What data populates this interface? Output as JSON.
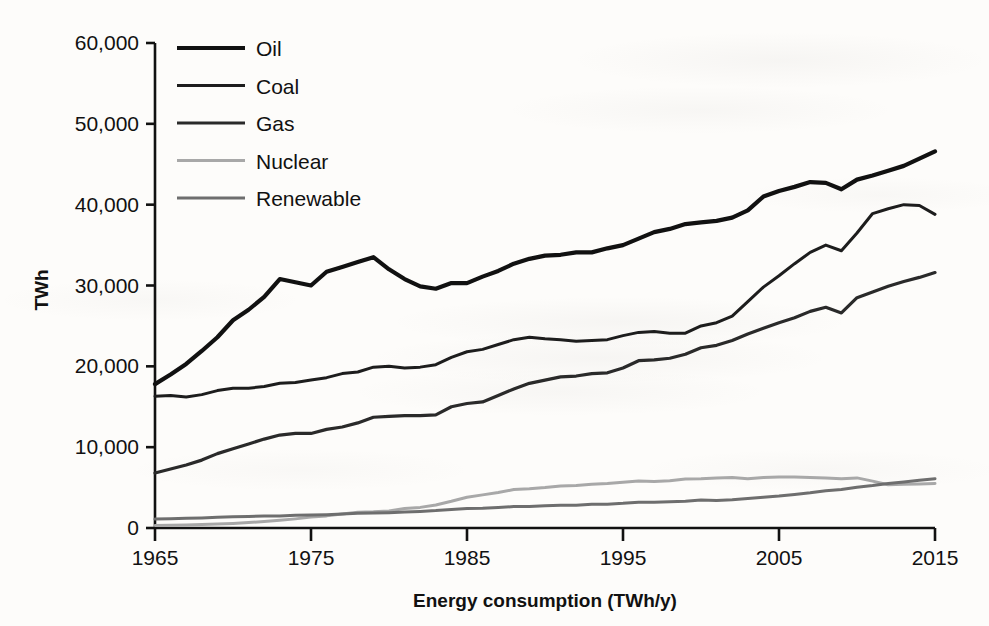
{
  "chart_data": {
    "type": "line",
    "title": "",
    "xlabel": "Energy consumption (TWh/y)",
    "ylabel": "TWh",
    "xlim": [
      1965,
      2015
    ],
    "ylim": [
      0,
      60000
    ],
    "xticks": [
      "1965",
      "1975",
      "1985",
      "1995",
      "2005",
      "2015"
    ],
    "xtick_values": [
      1965,
      1975,
      1985,
      1995,
      2005,
      2015
    ],
    "yticks": [
      "0",
      "10,000",
      "20,000",
      "30,000",
      "40,000",
      "50,000",
      "60,000"
    ],
    "ytick_values": [
      0,
      10000,
      20000,
      30000,
      40000,
      50000,
      60000
    ],
    "grid": false,
    "legend_position": "top-left",
    "x": [
      1965,
      1966,
      1967,
      1968,
      1969,
      1970,
      1971,
      1972,
      1973,
      1974,
      1975,
      1976,
      1977,
      1978,
      1979,
      1980,
      1981,
      1982,
      1983,
      1984,
      1985,
      1986,
      1987,
      1988,
      1989,
      1990,
      1991,
      1992,
      1993,
      1994,
      1995,
      1996,
      1997,
      1998,
      1999,
      2000,
      2001,
      2002,
      2003,
      2004,
      2005,
      2006,
      2007,
      2008,
      2009,
      2010,
      2011,
      2012,
      2013,
      2014,
      2015
    ],
    "series": [
      {
        "name": "Oil",
        "color": "#111111",
        "width": 4.2,
        "values": [
          17800,
          19000,
          20300,
          21900,
          23600,
          25700,
          27000,
          28600,
          30800,
          30400,
          30000,
          31700,
          32300,
          32900,
          33500,
          32000,
          30800,
          29900,
          29600,
          30300,
          30300,
          31100,
          31800,
          32700,
          33300,
          33700,
          33800,
          34100,
          34100,
          34600,
          35000,
          35800,
          36600,
          37000,
          37600,
          37800,
          38000,
          38400,
          39300,
          41000,
          41700,
          42200,
          42800,
          42700,
          41900,
          43100,
          43600,
          44200,
          44800,
          45700,
          46600
        ]
      },
      {
        "name": "Coal",
        "color": "#1d1d1d",
        "width": 3.0,
        "values": [
          16300,
          16400,
          16200,
          16500,
          17000,
          17300,
          17300,
          17500,
          17900,
          18000,
          18300,
          18600,
          19100,
          19300,
          19900,
          20000,
          19800,
          19900,
          20200,
          21100,
          21800,
          22100,
          22700,
          23300,
          23600,
          23400,
          23300,
          23100,
          23200,
          23300,
          23800,
          24200,
          24300,
          24100,
          24100,
          25000,
          25400,
          26200,
          28000,
          29800,
          31200,
          32700,
          34100,
          35000,
          34300,
          36500,
          38900,
          39500,
          40000,
          39900,
          38800
        ]
      },
      {
        "name": "Gas",
        "color": "#2a2a2a",
        "width": 3.2,
        "values": [
          6800,
          7300,
          7800,
          8400,
          9200,
          9800,
          10400,
          11000,
          11500,
          11700,
          11700,
          12200,
          12500,
          13000,
          13700,
          13800,
          13900,
          13900,
          14000,
          15000,
          15400,
          15600,
          16400,
          17200,
          17900,
          18300,
          18700,
          18800,
          19100,
          19200,
          19800,
          20700,
          20800,
          21000,
          21500,
          22300,
          22600,
          23200,
          24000,
          24700,
          25400,
          26000,
          26800,
          27300,
          26600,
          28500,
          29200,
          29900,
          30500,
          31000,
          31600
        ]
      },
      {
        "name": "Nuclear",
        "color": "#a8a8a8",
        "width": 3.0,
        "values": [
          300,
          330,
          370,
          430,
          500,
          570,
          680,
          800,
          950,
          1130,
          1350,
          1500,
          1720,
          1950,
          2000,
          2100,
          2400,
          2550,
          2850,
          3300,
          3800,
          4100,
          4400,
          4750,
          4850,
          5000,
          5200,
          5250,
          5400,
          5500,
          5650,
          5800,
          5750,
          5850,
          6050,
          6100,
          6200,
          6250,
          6100,
          6250,
          6300,
          6300,
          6250,
          6200,
          6100,
          6200,
          5800,
          5350,
          5400,
          5450,
          5500
        ]
      },
      {
        "name": "Renewable",
        "color": "#6e6e6e",
        "width": 3.0,
        "values": [
          1100,
          1150,
          1200,
          1250,
          1320,
          1380,
          1420,
          1480,
          1500,
          1580,
          1620,
          1650,
          1720,
          1820,
          1850,
          1900,
          1980,
          2050,
          2150,
          2300,
          2400,
          2450,
          2550,
          2650,
          2650,
          2750,
          2800,
          2800,
          2950,
          2950,
          3050,
          3200,
          3200,
          3250,
          3300,
          3450,
          3400,
          3500,
          3650,
          3800,
          3950,
          4150,
          4350,
          4600,
          4750,
          5050,
          5250,
          5500,
          5700,
          5900,
          6100
        ]
      }
    ]
  },
  "legend": {
    "items": [
      {
        "label": "Oil"
      },
      {
        "label": "Coal"
      },
      {
        "label": "Gas"
      },
      {
        "label": "Nuclear"
      },
      {
        "label": "Renewable"
      }
    ]
  }
}
